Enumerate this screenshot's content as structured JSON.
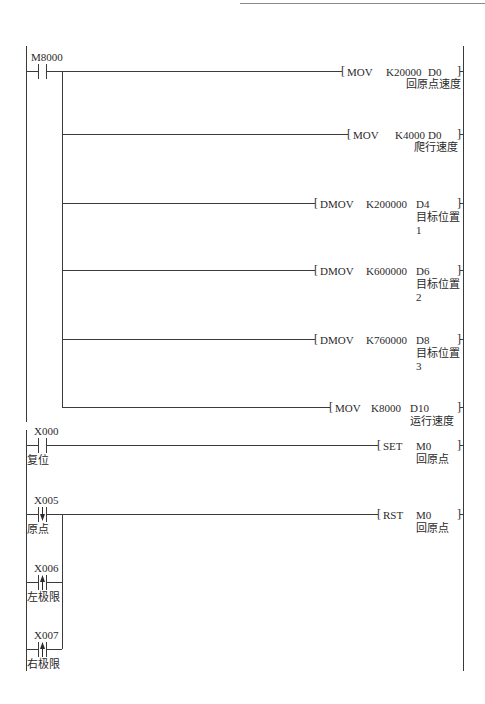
{
  "diagram": {
    "type": "PLC ladder diagram",
    "rungs": [
      {
        "contacts": [
          {
            "address": "M8000",
            "type": "normally-open",
            "comment": ""
          }
        ],
        "outputs": [
          {
            "instruction": "MOV",
            "source": "K20000",
            "dest": "D0",
            "comment": "回原点速度",
            "comment2": ""
          },
          {
            "instruction": "MOV",
            "source": "K4000",
            "dest": "D0",
            "comment": "爬行速度",
            "comment2": ""
          },
          {
            "instruction": "DMOV",
            "source": "K200000",
            "dest": "D4",
            "comment": "目标位置",
            "comment2": "1"
          },
          {
            "instruction": "DMOV",
            "source": "K600000",
            "dest": "D6",
            "comment": "目标位置",
            "comment2": "2"
          },
          {
            "instruction": "DMOV",
            "source": "K760000",
            "dest": "D8",
            "comment": "目标位置",
            "comment2": "3"
          },
          {
            "instruction": "MOV",
            "source": "K8000",
            "dest": "D10",
            "comment": "运行速度",
            "comment2": ""
          }
        ]
      },
      {
        "contacts": [
          {
            "address": "X000",
            "type": "normally-open",
            "comment": "复位"
          }
        ],
        "outputs": [
          {
            "instruction": "SET",
            "dest": "M0",
            "comment": "回原点"
          }
        ]
      },
      {
        "contacts": [
          {
            "address": "X005",
            "type": "falling-edge",
            "comment": "原点"
          },
          {
            "address": "X006",
            "type": "rising-edge",
            "comment": "左极限"
          },
          {
            "address": "X007",
            "type": "rising-edge",
            "comment": "右极限"
          }
        ],
        "outputs": [
          {
            "instruction": "RST",
            "dest": "M0",
            "comment": "回原点"
          }
        ]
      }
    ]
  },
  "brackets": {
    "open": "[",
    "close": "]"
  },
  "colors": {
    "line": "#3a3a3a",
    "text": "#2a2a2a",
    "background": "#ffffff"
  }
}
